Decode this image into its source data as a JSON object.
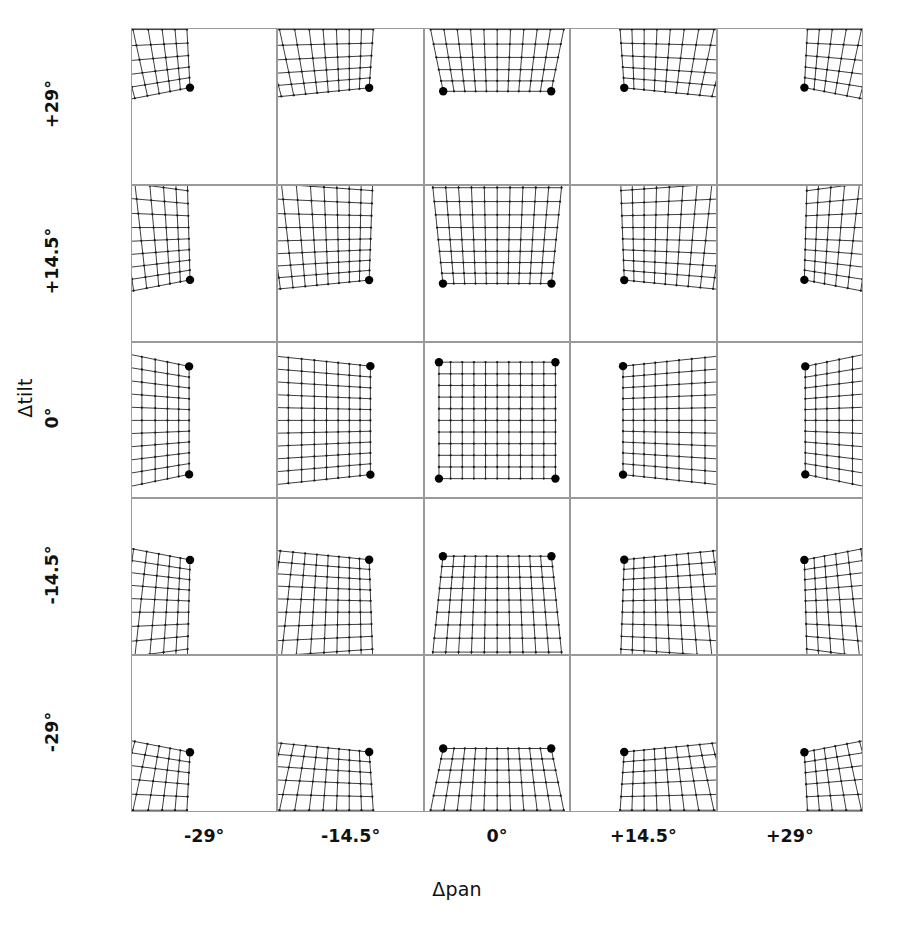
{
  "figure": {
    "kind": "panel-matrix",
    "x_axis": {
      "title": "Δpan",
      "ticks": [
        "-29°",
        "-14.5°",
        "0°",
        "+14.5°",
        "+29°"
      ],
      "values_deg": [
        -29,
        -14.5,
        0,
        14.5,
        29
      ]
    },
    "y_axis": {
      "title": "Δtilt",
      "ticks": [
        "+29°",
        "+14.5°",
        "0°",
        "-14.5°",
        "-29°"
      ],
      "values_deg": [
        29,
        14.5,
        0,
        -14.5,
        -29
      ]
    }
  },
  "chart_data": {
    "type": "scatter",
    "title": "",
    "subtitle": "",
    "xlabel": "Δpan",
    "ylabel": "Δtilt",
    "xlim": [
      -29,
      29
    ],
    "ylim": [
      -29,
      29
    ],
    "grid": false,
    "legend": null,
    "annotations": [],
    "categories": [
      "-29°",
      "-14.5°",
      "0°",
      "+14.5°",
      "+29°"
    ],
    "x": [
      -29,
      -14.5,
      0,
      14.5,
      29
    ],
    "values": [
      29,
      14.5,
      0,
      -14.5,
      -29
    ],
    "mesh": {
      "divisions": 10,
      "node_marker_radius": 1.15,
      "corner_marker_radius": 4.2,
      "reference_half_extent": 0.42,
      "focal_length_norm": 1.0,
      "line_color": "#1a1a1a",
      "corner_color": "#000000",
      "panel_border_color": "#9a9a9a",
      "background_color": "#ffffff"
    },
    "panels": [
      {
        "row": 0,
        "col": 0,
        "pan_deg": -29,
        "tilt_deg": 29
      },
      {
        "row": 0,
        "col": 1,
        "pan_deg": -14.5,
        "tilt_deg": 29
      },
      {
        "row": 0,
        "col": 2,
        "pan_deg": 0,
        "tilt_deg": 29
      },
      {
        "row": 0,
        "col": 3,
        "pan_deg": 14.5,
        "tilt_deg": 29
      },
      {
        "row": 0,
        "col": 4,
        "pan_deg": 29,
        "tilt_deg": 29
      },
      {
        "row": 1,
        "col": 0,
        "pan_deg": -29,
        "tilt_deg": 14.5
      },
      {
        "row": 1,
        "col": 1,
        "pan_deg": -14.5,
        "tilt_deg": 14.5
      },
      {
        "row": 1,
        "col": 2,
        "pan_deg": 0,
        "tilt_deg": 14.5
      },
      {
        "row": 1,
        "col": 3,
        "pan_deg": 14.5,
        "tilt_deg": 14.5
      },
      {
        "row": 1,
        "col": 4,
        "pan_deg": 29,
        "tilt_deg": 14.5
      },
      {
        "row": 2,
        "col": 0,
        "pan_deg": -29,
        "tilt_deg": 0
      },
      {
        "row": 2,
        "col": 1,
        "pan_deg": -14.5,
        "tilt_deg": 0
      },
      {
        "row": 2,
        "col": 2,
        "pan_deg": 0,
        "tilt_deg": 0
      },
      {
        "row": 2,
        "col": 3,
        "pan_deg": 14.5,
        "tilt_deg": 0
      },
      {
        "row": 2,
        "col": 4,
        "pan_deg": 29,
        "tilt_deg": 0
      },
      {
        "row": 3,
        "col": 0,
        "pan_deg": -29,
        "tilt_deg": -14.5
      },
      {
        "row": 3,
        "col": 1,
        "pan_deg": -14.5,
        "tilt_deg": -14.5
      },
      {
        "row": 3,
        "col": 2,
        "pan_deg": 0,
        "tilt_deg": -14.5
      },
      {
        "row": 3,
        "col": 3,
        "pan_deg": 14.5,
        "tilt_deg": -14.5
      },
      {
        "row": 3,
        "col": 4,
        "pan_deg": 29,
        "tilt_deg": -14.5
      },
      {
        "row": 4,
        "col": 0,
        "pan_deg": -29,
        "tilt_deg": -29
      },
      {
        "row": 4,
        "col": 1,
        "pan_deg": -14.5,
        "tilt_deg": -29
      },
      {
        "row": 4,
        "col": 2,
        "pan_deg": 0,
        "tilt_deg": -29
      },
      {
        "row": 4,
        "col": 3,
        "pan_deg": 14.5,
        "tilt_deg": -29
      },
      {
        "row": 4,
        "col": 4,
        "pan_deg": 29,
        "tilt_deg": -29
      }
    ]
  },
  "geometry": {
    "matrix_left": 131,
    "matrix_top": 28,
    "cell_width": 146.4,
    "cell_height": 156.8,
    "cols": 5,
    "rows": 5
  }
}
